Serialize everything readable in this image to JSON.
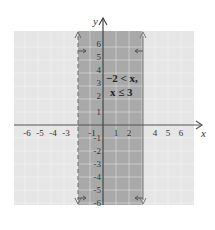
{
  "graph": {
    "x_axis_label": "x",
    "y_axis_label": "y",
    "x_tick_labels": [
      "-6",
      "-5",
      "-4",
      "-3",
      "-1",
      "1",
      "2",
      "4",
      "5",
      "6"
    ],
    "x_tick_values": [
      -6,
      -5,
      -4,
      -3,
      -1,
      1,
      2,
      4,
      5,
      6
    ],
    "y_tick_labels": [
      "6",
      "5",
      "4",
      "3",
      "2",
      "1",
      "-1",
      "-2",
      "-3",
      "-4",
      "-5",
      "-6"
    ],
    "y_tick_values": [
      6,
      5,
      4,
      3,
      2,
      1,
      -1,
      -2,
      -3,
      -4,
      -5,
      -6
    ],
    "inequality_line1": "−2 < x,",
    "inequality_line2": "x ≤ 3",
    "shaded_region": {
      "x_min": -2,
      "x_max": 3,
      "left_boundary": "dashed",
      "right_boundary": "solid"
    },
    "colors": {
      "background_grid": "#e4e4e4",
      "shaded_band": "#a8a8a8",
      "grid_lines": "#c8c8c8",
      "axis": "#555555"
    }
  }
}
